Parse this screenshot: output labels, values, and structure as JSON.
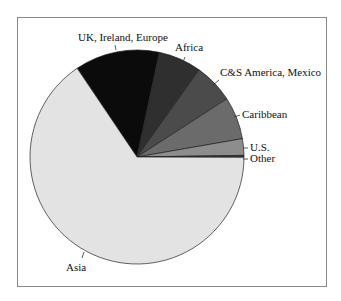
{
  "chart_data": {
    "type": "pie",
    "title": "",
    "start_angle_deg_clockwise_from_top": 326,
    "slices": [
      {
        "label": "UK, Ireland, Europe",
        "value": 12.8,
        "color": "#0b0b0b"
      },
      {
        "label": "Africa",
        "value": 6.5,
        "color": "#2f2f2f"
      },
      {
        "label": "C&S America, Mexico",
        "value": 6.0,
        "color": "#4b4b4b"
      },
      {
        "label": "Caribbean",
        "value": 6.4,
        "color": "#6b6b6b"
      },
      {
        "label": "U.S.",
        "value": 2.5,
        "color": "#8d8d8d"
      },
      {
        "label": "Other",
        "value": 0.3,
        "color": "#3a3a3a"
      },
      {
        "label": "Asia",
        "value": 65.5,
        "color": "#e3e3e3"
      }
    ],
    "legend": "none (labels with leader lines)"
  },
  "labels": {
    "uk": "UK, Ireland, Europe",
    "africa": "Africa",
    "csam": "C&S America, Mexico",
    "caribbean": "Caribbean",
    "us": "U.S.",
    "other": "Other",
    "asia": "Asia"
  }
}
